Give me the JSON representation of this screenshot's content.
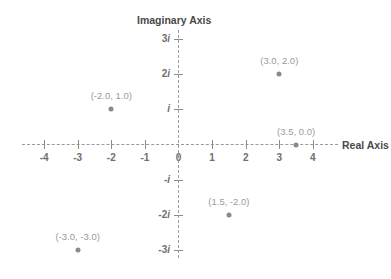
{
  "chart_data": {
    "type": "scatter",
    "title": "",
    "xlabel": "Real Axis",
    "ylabel": "Imaginary Axis",
    "xlim": [
      -4.6,
      4.6
    ],
    "ylim": [
      -3.4,
      3.4
    ],
    "grid": false,
    "legend": "none",
    "x_ticks": [
      {
        "value": -4,
        "label": "-4"
      },
      {
        "value": -3,
        "label": "-3"
      },
      {
        "value": -2,
        "label": "-2"
      },
      {
        "value": -1,
        "label": "-1"
      },
      {
        "value": 0,
        "label": "0"
      },
      {
        "value": 1,
        "label": "1"
      },
      {
        "value": 2,
        "label": "2"
      },
      {
        "value": 3,
        "label": "3"
      },
      {
        "value": 4,
        "label": "4"
      }
    ],
    "y_ticks": [
      {
        "value": 3,
        "label": "3i"
      },
      {
        "value": 2,
        "label": "2i"
      },
      {
        "value": 1,
        "label": "i"
      },
      {
        "value": -1,
        "label": "-i"
      },
      {
        "value": -2,
        "label": "-2i"
      },
      {
        "value": -3,
        "label": "-3i"
      }
    ],
    "points": [
      {
        "x": 3.0,
        "y": 2.0,
        "label": "(3.0, 2.0)"
      },
      {
        "x": -2.0,
        "y": 1.0,
        "label": "(-2.0, 1.0)"
      },
      {
        "x": 3.5,
        "y": 0.0,
        "label": "(3.5, 0.0)"
      },
      {
        "x": 1.5,
        "y": -2.0,
        "label": "(1.5, -2.0)"
      },
      {
        "x": -3.0,
        "y": -3.0,
        "label": "(-3.0, -3.0)"
      }
    ],
    "colors": {
      "point": "#8a8a8a",
      "point_label": "#9a9a9a",
      "axis": "#9a9a9a",
      "tick_label": "#6e6e6e",
      "axis_title": "#4a4a4a",
      "background": "#ffffff"
    }
  }
}
